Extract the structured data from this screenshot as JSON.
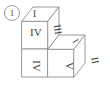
{
  "figure": {
    "label": "1",
    "caption_label_style": "circled-number",
    "stroke_color": "#8f8f8f",
    "text_color": "#3b3b3b",
    "background_color": "#ffffff",
    "cubes": [
      {
        "name": "upper-cube",
        "faces": {
          "top": "I",
          "front": "IV",
          "right": "III"
        }
      },
      {
        "name": "lower-right-cube",
        "faces": {
          "top": "I",
          "front": "V",
          "right": "II"
        }
      },
      {
        "name": "lower-left-cube",
        "faces": {
          "front": "IV"
        }
      }
    ]
  }
}
